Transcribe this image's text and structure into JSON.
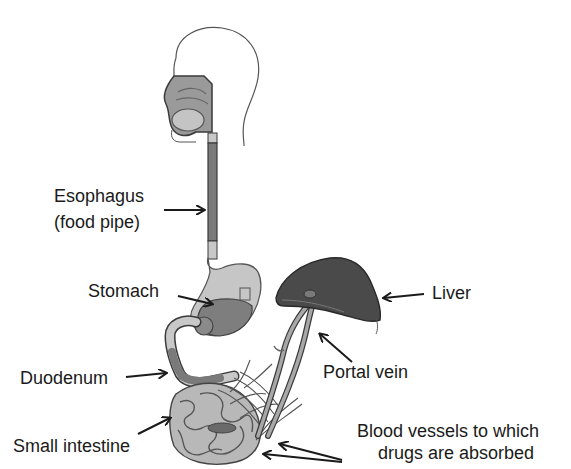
{
  "diagram": {
    "type": "anatomy-diagram",
    "labels": {
      "esophagus_line1": "Esophagus",
      "esophagus_line2": "(food pipe)",
      "stomach": "Stomach",
      "duodenum": "Duodenum",
      "small_intestine": "Small intestine",
      "liver": "Liver",
      "portal_vein": "Portal vein",
      "blood_vessels_line1": "Blood vessels to which",
      "blood_vessels_line2": "drugs are absorbed"
    },
    "colors": {
      "outline": "#3a3a3a",
      "organ_light": "#c8c8c8",
      "organ_mid": "#8a8a8a",
      "organ_dark": "#555555",
      "liver": "#4a4a4a",
      "vessel": "#9a9a9a",
      "text": "#1a1a1a"
    }
  }
}
